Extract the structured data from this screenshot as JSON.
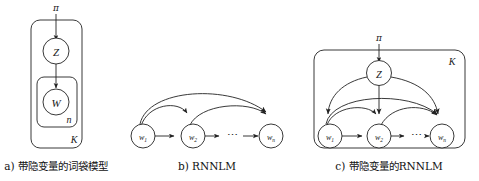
{
  "figure": {
    "panels": [
      {
        "id": "panel-a",
        "caption": "a) 带隐变量的词袋模型",
        "prior_label": "π",
        "nodes": [
          {
            "name": "latent-variable-node",
            "label": "Z"
          },
          {
            "name": "word-node",
            "label": "W"
          }
        ],
        "plates": [
          {
            "name": "plate-inner",
            "label": "n"
          },
          {
            "name": "plate-outer",
            "label": "K"
          }
        ]
      },
      {
        "id": "panel-b",
        "caption": "b) RNNLM",
        "nodes": [
          {
            "name": "word-node-1",
            "label": "w",
            "sub": "1"
          },
          {
            "name": "word-node-2",
            "label": "w",
            "sub": "2"
          },
          {
            "name": "word-node-n",
            "label": "w",
            "sub": "n"
          }
        ],
        "ellipsis": "⋯"
      },
      {
        "id": "panel-c",
        "caption": "c) 带隐变量的RNNLM",
        "prior_label": "π",
        "nodes": [
          {
            "name": "latent-variable-node",
            "label": "Z"
          },
          {
            "name": "word-node-1",
            "label": "w",
            "sub": "1"
          },
          {
            "name": "word-node-2",
            "label": "w",
            "sub": "2"
          },
          {
            "name": "word-node-n",
            "label": "w",
            "sub": "n"
          }
        ],
        "plates": [
          {
            "name": "plate-outer",
            "label": "K"
          }
        ],
        "ellipsis": "⋯"
      }
    ],
    "colors": {
      "stroke": "#222222",
      "node_fill": "#ffffff",
      "text": "#111111",
      "background": "#ffffff"
    }
  }
}
